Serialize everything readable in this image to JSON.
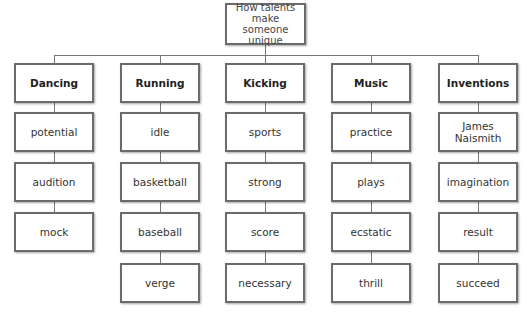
{
  "diagram": {
    "type": "tree",
    "root": {
      "label": "How talents make someone unique"
    },
    "columns": [
      {
        "header": "Dancing",
        "items": [
          "potential",
          "audition",
          "mock"
        ]
      },
      {
        "header": "Running",
        "items": [
          "idle",
          "basketball",
          "baseball",
          "verge"
        ]
      },
      {
        "header": "Kicking",
        "items": [
          "sports",
          "strong",
          "score",
          "necessary"
        ]
      },
      {
        "header": "Music",
        "items": [
          "practice",
          "plays",
          "ecstatic",
          "thrill"
        ]
      },
      {
        "header": "Inventions",
        "items": [
          "James Naismith",
          "imagination",
          "result",
          "succeed"
        ]
      }
    ]
  },
  "colors": {
    "border": "#6b6b6b",
    "connector": "#777777",
    "background": "#ffffff",
    "text": "#333333"
  }
}
